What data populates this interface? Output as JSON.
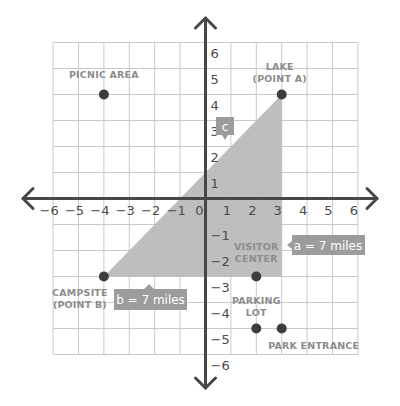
{
  "diagram": {
    "type": "coordinate_plane",
    "x_range": [
      -6,
      6
    ],
    "y_range": [
      -6,
      6
    ],
    "x_ticks": [
      "-6",
      "-5",
      "-4",
      "-3",
      "-2",
      "-1",
      "0",
      "1",
      "2",
      "3",
      "4",
      "5",
      "6"
    ],
    "y_ticks": [
      "6",
      "5",
      "4",
      "3",
      "2",
      "1",
      "-1",
      "-2",
      "-3",
      "-4",
      "-5",
      "-6"
    ],
    "colors": {
      "grid": "#c9c9c9",
      "axis": "#474747",
      "triangle": "#b9b9b9",
      "point": "#3d3d3d",
      "point_label": "#8c8c8c",
      "callout": "#9c9c9c",
      "callout_text": "#ffffff"
    },
    "points": [
      {
        "id": "picnic-area",
        "x": -4,
        "y": 4,
        "label_lines": [
          "PICNIC AREA"
        ]
      },
      {
        "id": "lake",
        "x": 3,
        "y": 4,
        "label_lines": [
          "LAKE",
          "(POINT A)"
        ]
      },
      {
        "id": "campsite",
        "x": -4,
        "y": -3,
        "label_lines": [
          "CAMPSITE",
          "(POINT B)"
        ]
      },
      {
        "id": "visitor-center",
        "x": 2,
        "y": -3,
        "label_lines": [
          "VISITOR",
          "CENTER"
        ]
      },
      {
        "id": "parking-lot",
        "x": 2,
        "y": -5,
        "label_lines": [
          "PARKING",
          "LOT"
        ]
      },
      {
        "id": "park-entrance",
        "x": 3,
        "y": -5,
        "label_lines": [
          "PARK ENTRANCE"
        ]
      }
    ],
    "triangle": {
      "vertices": [
        [
          -4,
          -3
        ],
        [
          3,
          4
        ],
        [
          3,
          -3
        ]
      ]
    },
    "callouts": {
      "a": "a = 7 miles",
      "b": "b = 7 miles",
      "c": "c"
    }
  }
}
